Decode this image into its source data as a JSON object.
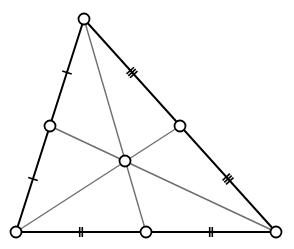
{
  "diagram": {
    "title": "",
    "colors": {
      "sides": "#000000",
      "medians": "#6e6e6e",
      "points_fill": "#ffffff",
      "background": "#ffffff"
    },
    "vertices": {
      "top": {
        "x": 84,
        "y": 19
      },
      "bottom_left": {
        "x": 16,
        "y": 232
      },
      "bottom_right": {
        "x": 276,
        "y": 232
      }
    },
    "midpoints": {
      "left_side": {
        "x": 50,
        "y": 126,
        "ticks": 1
      },
      "right_side": {
        "x": 180,
        "y": 126,
        "ticks": 3
      },
      "bottom_side": {
        "x": 146,
        "y": 232,
        "ticks": 2
      }
    },
    "centroid": {
      "x": 125,
      "y": 161
    },
    "medians": [
      {
        "from": "top",
        "to": "bottom_side"
      },
      {
        "from": "bottom_left",
        "to": "right_side"
      },
      {
        "from": "bottom_right",
        "to": "left_side"
      }
    ],
    "tick_marks": [
      {
        "segment": "top-left_mid",
        "count": 1
      },
      {
        "segment": "left_mid-bottom_left",
        "count": 1
      },
      {
        "segment": "top-right_mid",
        "count": 3
      },
      {
        "segment": "right_mid-bottom_right",
        "count": 3
      },
      {
        "segment": "bottom_left-bottom_mid",
        "count": 2
      },
      {
        "segment": "bottom_mid-bottom_right",
        "count": 2
      }
    ]
  }
}
